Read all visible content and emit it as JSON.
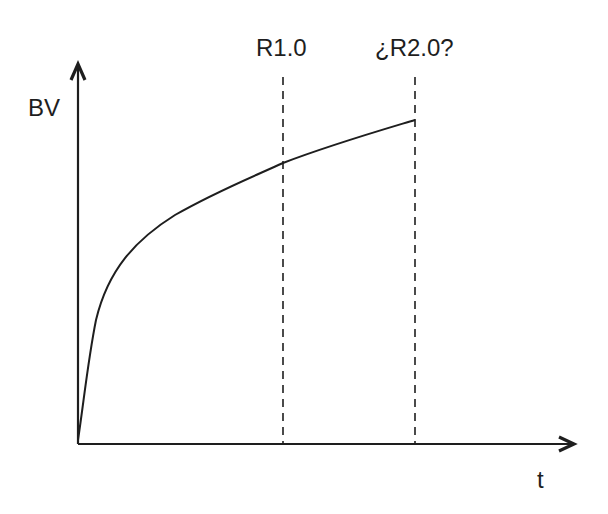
{
  "diagram": {
    "y_axis_label": "BV",
    "x_axis_label": "t",
    "markers": [
      {
        "label": "R1.0"
      },
      {
        "label": "¿R2.0?"
      }
    ],
    "colors": {
      "line": "#1e1e1e",
      "background": "#ffffff"
    }
  }
}
